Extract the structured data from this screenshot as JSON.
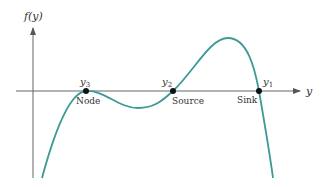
{
  "diagram": {
    "y_axis_label": "f(y)",
    "x_axis_label": "y",
    "curve_color": "#3d9a96",
    "axis_color": "#555555",
    "equilibria": [
      {
        "symbol": "y",
        "subscript": "3",
        "type": "Node"
      },
      {
        "symbol": "y",
        "subscript": "2",
        "type": "Source"
      },
      {
        "symbol": "y",
        "subscript": "1",
        "type": "Sink"
      }
    ]
  }
}
